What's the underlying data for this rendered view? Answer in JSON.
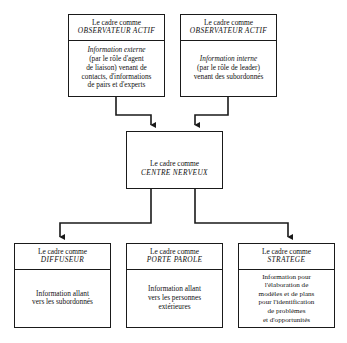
{
  "diagram": {
    "nodes": {
      "observer_external": {
        "title_top": "Le cadre comme",
        "title_emph": "OBSERVATEUR ACTIF",
        "body_lines": [
          "Information externe",
          "(par le rôle d'agent",
          "de liaison) venant de",
          "contacts, d'informations",
          "de pairs et d'experts"
        ]
      },
      "observer_internal": {
        "title_top": "Le cadre comme",
        "title_emph": "OBSERVATEUR ACTIF",
        "body_lines": [
          "Information interne",
          "(par le rôle de leader)",
          "venant des subordonnés"
        ]
      },
      "nerve_center": {
        "title_top": "Le cadre comme",
        "title_emph": "CENTRE NERVEUX",
        "body_lines": []
      },
      "diffuser": {
        "title_top": "Le cadre comme",
        "title_emph": "DIFFUSEUR",
        "body_lines": [
          "Information allant",
          "vers les subordonnés"
        ]
      },
      "spokesperson": {
        "title_top": "Le cadre comme",
        "title_emph": "PORTE PAROLE",
        "body_lines": [
          "Information allant",
          "vers les personnes",
          "extérieures"
        ]
      },
      "strategist": {
        "title_top": "Le cadre comme",
        "title_emph": "STRATEGE",
        "body_lines": [
          "Information pour",
          "l'élaboration de",
          "modèles et de plans",
          "pour l'identification",
          "de problèmes",
          "et d'opportunités"
        ]
      }
    },
    "colors": {
      "stroke": "#1a1a1a",
      "text": "#111111",
      "background": "#ffffff"
    }
  }
}
